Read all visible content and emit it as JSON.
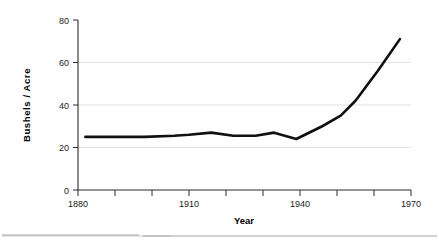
{
  "chart_data": {
    "type": "line",
    "title": "",
    "xlabel": "Year",
    "ylabel": "Bushels / Acre",
    "xlim": [
      1880,
      1970
    ],
    "ylim": [
      0,
      80
    ],
    "grid": true,
    "legend": "none",
    "x_ticks": [
      1880,
      1890,
      1900,
      1910,
      1920,
      1930,
      1940,
      1950,
      1960,
      1970
    ],
    "x_tick_labels": [
      "1880",
      "",
      "",
      "1910",
      "",
      "",
      "1940",
      "",
      "",
      "1970"
    ],
    "x_major_labels": [
      "1880",
      "1910",
      "1940",
      "1970"
    ],
    "y_ticks": [
      0,
      20,
      40,
      60,
      80
    ],
    "y_tick_labels": [
      "0",
      "20",
      "40",
      "60",
      "80"
    ],
    "gridlines_y": [
      20,
      40,
      60
    ],
    "series": [
      {
        "name": "Corn yield",
        "color": "#101010",
        "x": [
          1882,
          1890,
          1898,
          1906,
          1910,
          1916,
          1922,
          1928,
          1933,
          1939,
          1946,
          1951,
          1955,
          1961,
          1967
        ],
        "values": [
          25,
          25,
          25,
          25.5,
          26,
          27,
          25.5,
          25.5,
          27,
          24,
          30,
          35,
          42,
          56,
          71
        ]
      }
    ],
    "annotations": []
  },
  "axis_labels": {
    "y_title": "Bushels / Acre",
    "x_title": "Year",
    "y_80": "80",
    "y_60": "60",
    "y_40": "40",
    "y_20": "20",
    "y_0": "0",
    "x_1880": "1880",
    "x_1910": "1910",
    "x_1940": "1940",
    "x_1970": "1970"
  },
  "colors": {
    "line": "#101010",
    "axis": "#2b2b2b",
    "grid": "#d9d9d9",
    "background": "#ffffff",
    "footer_rule": "#9a9a9a"
  }
}
